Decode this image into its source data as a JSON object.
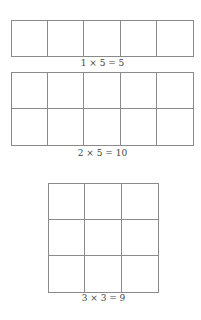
{
  "diagrams": [
    {
      "rows": 1,
      "cols": 5,
      "label": "1 × 5 = 5"
    },
    {
      "rows": 2,
      "cols": 5,
      "label": "2 × 5 = 10"
    },
    {
      "rows": 3,
      "cols": 3,
      "label": "3 × 3 = 9"
    }
  ],
  "colors": {
    "line": "#8a8a8a",
    "text": "#444444",
    "background": "#ffffff"
  }
}
